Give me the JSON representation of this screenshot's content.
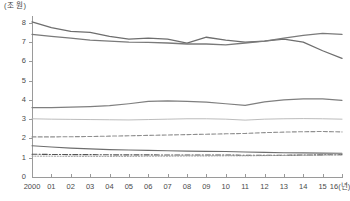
{
  "chart_data": {
    "type": "line",
    "title": "",
    "subtitle": "",
    "xlabel": "",
    "ylabel": "(조 원)",
    "unit_label": "(조 원)",
    "x_axis_suffix": "(년)",
    "categories": [
      "2000",
      "01",
      "02",
      "03",
      "04",
      "05",
      "06",
      "07",
      "08",
      "09",
      "10",
      "11",
      "12",
      "13",
      "14",
      "15",
      "16"
    ],
    "x_tick_labels": [
      "2000",
      "01",
      "02",
      "03",
      "04",
      "05",
      "06",
      "07",
      "08",
      "09",
      "10",
      "11",
      "12",
      "13",
      "14",
      "15",
      "16(년)"
    ],
    "y_tick_labels": [
      "0",
      "1",
      "2",
      "3",
      "4",
      "5",
      "6",
      "7",
      "8"
    ],
    "y_ticks": [
      0,
      1,
      2,
      3,
      4,
      5,
      6,
      7,
      8
    ],
    "ylim": [
      0,
      8.3
    ],
    "xlim": [
      0,
      16
    ],
    "grid": false,
    "legend": "none",
    "legend_position": "none",
    "series": [
      {
        "name": "series-1",
        "style": "solid",
        "width": 1.3,
        "color": "#6e6e6e",
        "values": [
          8.05,
          7.75,
          7.55,
          7.5,
          7.3,
          7.15,
          7.2,
          7.15,
          6.95,
          7.25,
          7.1,
          7.0,
          7.05,
          7.15,
          7.0,
          6.55,
          6.15
        ]
      },
      {
        "name": "series-2",
        "style": "solid",
        "width": 1.3,
        "color": "#7a7a7a",
        "values": [
          7.4,
          7.3,
          7.2,
          7.1,
          7.05,
          7.0,
          6.98,
          6.95,
          6.9,
          6.9,
          6.85,
          6.95,
          7.05,
          7.2,
          7.35,
          7.45,
          7.4
        ]
      },
      {
        "name": "series-3",
        "style": "solid",
        "width": 1.2,
        "color": "#7f7f7f",
        "values": [
          3.6,
          3.6,
          3.62,
          3.65,
          3.7,
          3.8,
          3.92,
          3.95,
          3.92,
          3.88,
          3.8,
          3.72,
          3.9,
          4.0,
          4.05,
          4.05,
          3.98
        ]
      },
      {
        "name": "series-4",
        "style": "solid",
        "width": 0.9,
        "color": "#b4b4b4",
        "values": [
          3.02,
          3.0,
          2.99,
          2.98,
          2.97,
          2.96,
          2.98,
          3.0,
          3.02,
          3.02,
          3.0,
          2.95,
          3.0,
          3.02,
          3.03,
          3.02,
          3.0
        ]
      },
      {
        "name": "series-5",
        "style": "dashed",
        "width": 1.1,
        "color": "#8f8f8f",
        "values": [
          2.08,
          2.08,
          2.09,
          2.1,
          2.12,
          2.14,
          2.16,
          2.18,
          2.2,
          2.22,
          2.24,
          2.26,
          2.3,
          2.33,
          2.35,
          2.36,
          2.34
        ]
      },
      {
        "name": "series-6",
        "style": "solid",
        "width": 1.1,
        "color": "#6e6e6e",
        "values": [
          1.62,
          1.56,
          1.5,
          1.46,
          1.42,
          1.4,
          1.38,
          1.36,
          1.34,
          1.33,
          1.32,
          1.3,
          1.28,
          1.26,
          1.25,
          1.24,
          1.23
        ]
      },
      {
        "name": "series-7",
        "style": "dashdot",
        "width": 1.1,
        "color": "#555555",
        "values": [
          1.18,
          1.17,
          1.16,
          1.16,
          1.15,
          1.15,
          1.15,
          1.14,
          1.14,
          1.14,
          1.14,
          1.13,
          1.13,
          1.13,
          1.14,
          1.15,
          1.16
        ]
      },
      {
        "name": "series-8",
        "style": "dotted",
        "width": 1.0,
        "color": "#9e9e9e",
        "values": [
          1.08,
          1.08,
          1.07,
          1.07,
          1.07,
          1.07,
          1.08,
          1.08,
          1.09,
          1.09,
          1.1,
          1.1,
          1.11,
          1.12,
          1.13,
          1.14,
          1.15
        ]
      }
    ],
    "colors": {
      "axis": "#9a9a9a",
      "text": "#4a4a4a",
      "background": "#ffffff"
    }
  }
}
